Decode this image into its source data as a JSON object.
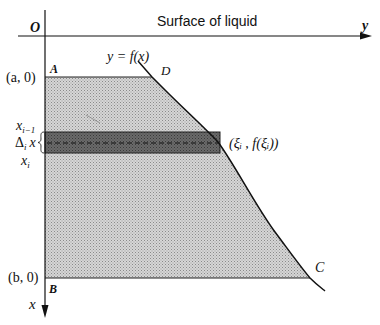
{
  "diagram": {
    "surface_label": "Surface of liquid",
    "origin_label": "O",
    "y_axis_label": "y",
    "x_axis_label": "x",
    "curve_label": "y = f(x)",
    "points": {
      "A": "A",
      "B": "B",
      "C": "C",
      "D": "D"
    },
    "left_labels": {
      "a0": "(a, 0)",
      "b0": "(b, 0)",
      "x_im1": "x",
      "x_im1_sub": "i−1",
      "delta": "Δ",
      "delta_sub": "i",
      "delta_x": "x",
      "x_i": "x",
      "x_i_sub": "i"
    },
    "strip_point_label": "(ξᵢ , f(ξᵢ))",
    "colors": {
      "region_fill": "#c8c8c8",
      "strip_fill": "#5a5a5a",
      "line": "#111111"
    }
  }
}
